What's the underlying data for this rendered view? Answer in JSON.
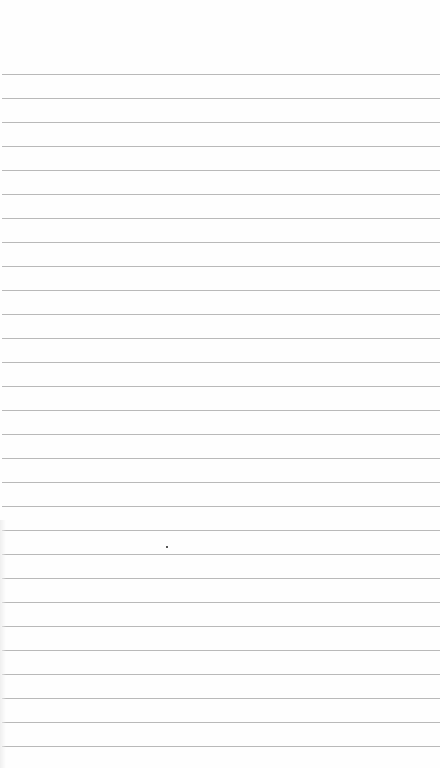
{
  "paper": {
    "type": "lined-paper",
    "background_color": "#fefefe",
    "rule_color": "#b9b9b9",
    "first_rule_y": 74,
    "rule_spacing": 24,
    "rule_count": 29
  }
}
